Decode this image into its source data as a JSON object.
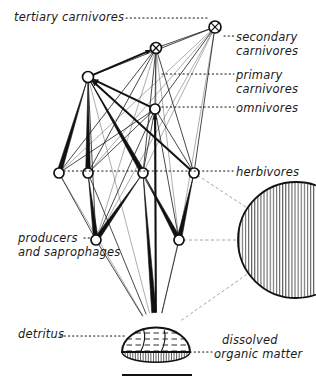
{
  "figure": {
    "kind": "food-web-diagram",
    "background_color": "#ffffff",
    "ink_color": "#111111",
    "width": 316,
    "height": 389
  },
  "labels": {
    "tertiary_carnivores": "tertiary carnivores",
    "secondary": "secondary",
    "secondary_carnivores": "carnivores",
    "primary": "primary",
    "primary_carnivores": "carnivores",
    "omnivores": "omnivores",
    "herbivores": "herbivores",
    "producers": "producers",
    "and_saprophages": "and saprophages",
    "detritus": "detritus",
    "dissolved": "dissolved",
    "organic_matter": "organic matter"
  },
  "label_positions": {
    "tertiary_carnivores": {
      "x": 14,
      "y": 11,
      "align": "left"
    },
    "secondary": {
      "x": 236,
      "y": 31,
      "align": "left"
    },
    "secondary_carnivores": {
      "x": 236,
      "y": 45,
      "align": "left"
    },
    "primary": {
      "x": 236,
      "y": 69,
      "align": "left"
    },
    "primary_carnivores": {
      "x": 236,
      "y": 83,
      "align": "left"
    },
    "omnivores": {
      "x": 236,
      "y": 102,
      "align": "left"
    },
    "herbivores": {
      "x": 236,
      "y": 166,
      "align": "left"
    },
    "producers": {
      "x": 18,
      "y": 232,
      "align": "left"
    },
    "and_saprophages": {
      "x": 18,
      "y": 246,
      "align": "left"
    },
    "detritus": {
      "x": 18,
      "y": 328,
      "align": "left"
    },
    "dissolved": {
      "x": 222,
      "y": 334,
      "align": "left"
    },
    "organic_matter": {
      "x": 214,
      "y": 348,
      "align": "left"
    }
  },
  "chart_data": {
    "type": "diagram",
    "title": "",
    "trophic_levels": [
      {
        "name": "tertiary carnivores",
        "y": 27,
        "node_ids": [
          "T1"
        ]
      },
      {
        "name": "secondary carnivores",
        "y": 48,
        "node_ids": [
          "S1"
        ]
      },
      {
        "name": "primary carnivores",
        "y": 77,
        "node_ids": [
          "P1"
        ]
      },
      {
        "name": "omnivores",
        "y": 109,
        "node_ids": [
          "O1"
        ]
      },
      {
        "name": "herbivores",
        "y": 173,
        "node_ids": [
          "H1",
          "H2",
          "H3",
          "H4"
        ]
      },
      {
        "name": "producers and saprophages",
        "y": 240,
        "node_ids": [
          "R1",
          "R2"
        ]
      },
      {
        "name": "detritus",
        "y": 338,
        "node_ids": [
          "D1"
        ]
      },
      {
        "name": "dissolved organic matter",
        "y": 240,
        "node_ids": [
          "M1"
        ]
      }
    ],
    "nodes": [
      {
        "id": "T1",
        "label": "tertiary carnivores",
        "x": 215,
        "y": 27,
        "r": 6,
        "shape": "circle-cross"
      },
      {
        "id": "S1",
        "label": "secondary carnivores",
        "x": 156,
        "y": 48,
        "r": 5.5,
        "shape": "circle-cross"
      },
      {
        "id": "P1",
        "label": "primary carnivores",
        "x": 88,
        "y": 77,
        "r": 5.5,
        "shape": "circle"
      },
      {
        "id": "O1",
        "label": "omnivores",
        "x": 155,
        "y": 109,
        "r": 5,
        "shape": "circle"
      },
      {
        "id": "H1",
        "label": "herbivore 1",
        "x": 59,
        "y": 173,
        "r": 5,
        "shape": "circle"
      },
      {
        "id": "H2",
        "label": "herbivore 2",
        "x": 88,
        "y": 173,
        "r": 5,
        "shape": "circle"
      },
      {
        "id": "H3",
        "label": "herbivore 3",
        "x": 143,
        "y": 173,
        "r": 5,
        "shape": "circle"
      },
      {
        "id": "H4",
        "label": "herbivore 4",
        "x": 194,
        "y": 173,
        "r": 5,
        "shape": "circle"
      },
      {
        "id": "R1",
        "label": "producer 1",
        "x": 96,
        "y": 240,
        "r": 5,
        "shape": "circle"
      },
      {
        "id": "R2",
        "label": "producer 2",
        "x": 179,
        "y": 240,
        "r": 5,
        "shape": "circle"
      },
      {
        "id": "D1",
        "label": "detritus",
        "x": 156,
        "y": 338,
        "r": 34,
        "shape": "dome"
      },
      {
        "id": "M1",
        "label": "dissolved organic matter",
        "x": 296,
        "y": 240,
        "r": 58,
        "shape": "hatched-circle"
      }
    ],
    "link_weights": {
      "thick": 4.5,
      "medium": 2,
      "thin": 0.9,
      "hair": 0.55
    },
    "links": [
      {
        "from": "P1",
        "to": "T1",
        "weight": "thin"
      },
      {
        "from": "S1",
        "to": "T1",
        "weight": "thin"
      },
      {
        "from": "O1",
        "to": "T1",
        "weight": "thin"
      },
      {
        "from": "H1",
        "to": "T1",
        "weight": "hair"
      },
      {
        "from": "H2",
        "to": "T1",
        "weight": "hair"
      },
      {
        "from": "H3",
        "to": "T1",
        "weight": "hair"
      },
      {
        "from": "H4",
        "to": "T1",
        "weight": "thin"
      },
      {
        "from": "R1",
        "to": "T1",
        "weight": "hair"
      },
      {
        "from": "R2",
        "to": "T1",
        "weight": "hair"
      },
      {
        "from": "P1",
        "to": "S1",
        "weight": "medium"
      },
      {
        "from": "O1",
        "to": "S1",
        "weight": "thin"
      },
      {
        "from": "H1",
        "to": "S1",
        "weight": "thin"
      },
      {
        "from": "H2",
        "to": "S1",
        "weight": "thin"
      },
      {
        "from": "H3",
        "to": "S1",
        "weight": "thin"
      },
      {
        "from": "H4",
        "to": "S1",
        "weight": "thin"
      },
      {
        "from": "R1",
        "to": "S1",
        "weight": "hair"
      },
      {
        "from": "R2",
        "to": "S1",
        "weight": "hair"
      },
      {
        "from": "D1",
        "to": "S1",
        "weight": "hair"
      },
      {
        "from": "O1",
        "to": "P1",
        "weight": "medium"
      },
      {
        "from": "H1",
        "to": "P1",
        "weight": "thick"
      },
      {
        "from": "H2",
        "to": "P1",
        "weight": "thick"
      },
      {
        "from": "H3",
        "to": "P1",
        "weight": "thick"
      },
      {
        "from": "H4",
        "to": "P1",
        "weight": "medium"
      },
      {
        "from": "R1",
        "to": "P1",
        "weight": "thin"
      },
      {
        "from": "R2",
        "to": "P1",
        "weight": "thin"
      },
      {
        "from": "D1",
        "to": "P1",
        "weight": "hair"
      },
      {
        "from": "H1",
        "to": "O1",
        "weight": "thin"
      },
      {
        "from": "H2",
        "to": "O1",
        "weight": "thin"
      },
      {
        "from": "H3",
        "to": "O1",
        "weight": "thin"
      },
      {
        "from": "H4",
        "to": "O1",
        "weight": "thin"
      },
      {
        "from": "R1",
        "to": "O1",
        "weight": "thin"
      },
      {
        "from": "R2",
        "to": "O1",
        "weight": "thin"
      },
      {
        "from": "D1",
        "to": "O1",
        "weight": "medium"
      },
      {
        "from": "R1",
        "to": "H1",
        "weight": "thin"
      },
      {
        "from": "R1",
        "to": "H2",
        "weight": "thick"
      },
      {
        "from": "R1",
        "to": "H3",
        "weight": "thick"
      },
      {
        "from": "R2",
        "to": "H3",
        "weight": "thick"
      },
      {
        "from": "R2",
        "to": "H4",
        "weight": "thick"
      },
      {
        "from": "D1",
        "to": "H1",
        "weight": "hair"
      },
      {
        "from": "D1",
        "to": "H2",
        "weight": "thin"
      },
      {
        "from": "D1",
        "to": "H3",
        "weight": "thick"
      },
      {
        "from": "D1",
        "to": "H4",
        "weight": "hair"
      },
      {
        "from": "D1",
        "to": "R1",
        "weight": "thin"
      },
      {
        "from": "D1",
        "to": "R2",
        "weight": "thin"
      },
      {
        "from": "M1",
        "to": "H4",
        "weight": "hair"
      },
      {
        "from": "M1",
        "to": "D1",
        "weight": "hair"
      },
      {
        "from": "M1",
        "to": "R2",
        "weight": "hair"
      }
    ],
    "leader_lines": [
      {
        "label": "tertiary_carnivores",
        "from_x": 126,
        "to_x": 208,
        "y": 18
      },
      {
        "label": "secondary",
        "from_x": 224,
        "to_x": 234,
        "y": 36
      },
      {
        "label": "primary",
        "from_x": 162,
        "to_x": 234,
        "y": 74
      },
      {
        "label": "omnivores",
        "from_x": 162,
        "to_x": 234,
        "y": 107
      },
      {
        "label": "herbivores",
        "from_x": 64,
        "to_x": 234,
        "y": 171
      },
      {
        "label": "producers",
        "from_x": 84,
        "to_x": 92,
        "y": 238
      },
      {
        "label": "detritus",
        "from_x": 60,
        "to_x": 126,
        "y": 336
      },
      {
        "label": "organic_matter",
        "from_x": 190,
        "to_x": 212,
        "y": 352
      }
    ],
    "scale_bar": {
      "x1": 122,
      "x2": 192,
      "y": 375,
      "thickness": 2
    }
  }
}
